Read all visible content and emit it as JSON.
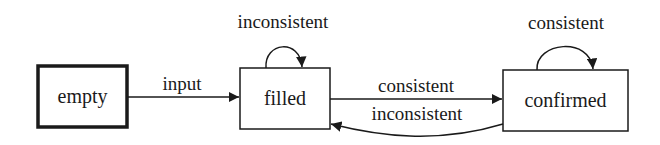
{
  "diagram": {
    "type": "state-machine",
    "states": [
      {
        "id": "empty",
        "label": "empty",
        "initial": true
      },
      {
        "id": "filled",
        "label": "filled"
      },
      {
        "id": "confirmed",
        "label": "confirmed"
      }
    ],
    "transitions": [
      {
        "from": "empty",
        "to": "filled",
        "label": "input"
      },
      {
        "from": "filled",
        "to": "filled",
        "label": "inconsistent"
      },
      {
        "from": "filled",
        "to": "confirmed",
        "label": "consistent"
      },
      {
        "from": "confirmed",
        "to": "filled",
        "label": "inconsistent"
      },
      {
        "from": "confirmed",
        "to": "confirmed",
        "label": "consistent"
      }
    ],
    "colors": {
      "stroke": "#1a1a1a",
      "background": "#ffffff"
    }
  }
}
